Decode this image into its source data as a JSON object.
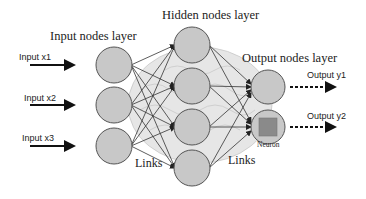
{
  "labels": {
    "input_layer": "Input nodes layer",
    "hidden_layer": "Hidden nodes layer",
    "output_layer": "Output nodes layer",
    "links_left": "Links",
    "links_right": "Links",
    "neuron": "Neuron"
  },
  "inputs": [
    {
      "label": "Input x1"
    },
    {
      "label": "Input x2"
    },
    {
      "label": "Input x3"
    }
  ],
  "outputs": [
    {
      "label": "Output y1"
    },
    {
      "label": "Output y2"
    }
  ],
  "colors": {
    "node_fill": "#c8c8c8",
    "node_stroke": "#555555",
    "neuron_square": "#8a8a8a",
    "brain_fill": "#e6e6e6"
  }
}
